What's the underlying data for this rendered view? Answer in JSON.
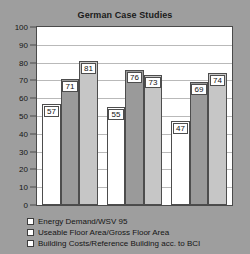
{
  "chart_data": {
    "type": "bar",
    "title": "German Case Studies",
    "xlabel": "",
    "ylabel": "",
    "ylim": [
      0,
      100
    ],
    "yticks": [
      0,
      10,
      20,
      30,
      40,
      50,
      60,
      70,
      80,
      90,
      100
    ],
    "grid": true,
    "legend_position": "bottom",
    "categories": [
      "Case Study 1",
      "Case Study 2",
      "Case Study 3"
    ],
    "series": [
      {
        "name": "Energy Demand/WSV 95",
        "color": "#ffffff",
        "values": [
          57,
          55,
          47
        ]
      },
      {
        "name": "Useable Floor Area/Gross Floor Area",
        "color": "#9a9a9a",
        "values": [
          71,
          76,
          69
        ]
      },
      {
        "name": "Building Costs/Reference Building acc. to BCI",
        "color": "#c6c6c6",
        "values": [
          81,
          73,
          74
        ]
      }
    ],
    "bars_in_draw_order": [
      {
        "value": 57,
        "series": "Energy Demand/WSV 95",
        "group": 1,
        "color": "#ffffff"
      },
      {
        "value": 71,
        "series": "Useable Floor Area/Gross Floor Area",
        "group": 1,
        "color": "#9a9a9a"
      },
      {
        "value": 81,
        "series": "Building Costs/Reference Building acc. to BCI",
        "group": 1,
        "color": "#c6c6c6"
      },
      {
        "value": 55,
        "series": "Energy Demand/WSV 95",
        "group": 2,
        "color": "#ffffff"
      },
      {
        "value": 76,
        "series": "Useable Floor Area/Gross Floor Area",
        "group": 2,
        "color": "#9a9a9a"
      },
      {
        "value": 73,
        "series": "Building Costs/Reference Building acc. to BCI",
        "group": 2,
        "color": "#c6c6c6"
      },
      {
        "value": 47,
        "series": "Energy Demand/WSV 95",
        "group": 3,
        "color": "#ffffff"
      },
      {
        "value": 69,
        "series": "Useable Floor Area/Gross Floor Area",
        "group": 3,
        "color": "#9a9a9a"
      },
      {
        "value": 74,
        "series": "Building Costs/Reference Building acc. to BCI",
        "group": 3,
        "color": "#c6c6c6"
      }
    ]
  },
  "legend": {
    "items": [
      {
        "label": "Energy Demand/WSV 95"
      },
      {
        "label": "Useable Floor Area/Gross Floor Area"
      },
      {
        "label": "Building Costs/Reference Building acc. to BCI"
      }
    ]
  },
  "colors": {
    "background": "#9e9e9e",
    "plot_background": "#ffffff",
    "axis": "#4a4a4a",
    "gridline": "#b9b9b9",
    "text": "#151515"
  }
}
